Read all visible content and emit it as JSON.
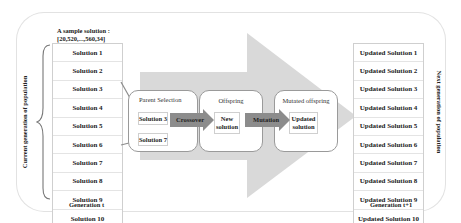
{
  "sample_solution": {
    "label": "A sample solution :",
    "value": "[20,520,...,560,34]"
  },
  "current_population": {
    "side_label": "Current generation of population",
    "footer": "Generation t",
    "items": [
      "Solution 1",
      "Solution 2",
      "Solution 3",
      "Solution 4",
      "Solution 5",
      "Solution 6",
      "Solution 7",
      "Solution 8",
      "Solution 9",
      "Solution 10"
    ]
  },
  "next_population": {
    "side_label": "Next generation of population",
    "footer": "Generation t+1",
    "items": [
      "Updated Solution 1",
      "Updated Solution 2",
      "Updated Solution 3",
      "Updated Solution 4",
      "Updated Solution 5",
      "Updated Solution 6",
      "Updated Solution 7",
      "Updated Solution 8",
      "Updated Solution 9",
      "Updated Solution 10"
    ]
  },
  "stages": {
    "parent_selection": {
      "title": "Parent Selection",
      "parents": [
        "Solution 3",
        "Solution 7"
      ]
    },
    "offspring": {
      "title": "Offspring",
      "box": "New solution"
    },
    "mutated": {
      "title": "Mutated offspring",
      "box": "Updated solution"
    }
  },
  "operators": {
    "crossover": "Crossover",
    "mutation": "Mutation"
  },
  "colors": {
    "big_arrow": "#d9d9d9",
    "op_arrow": "#8c8c8c",
    "stage_border": "#9a9a9a",
    "frame": "#e2e2e2"
  }
}
